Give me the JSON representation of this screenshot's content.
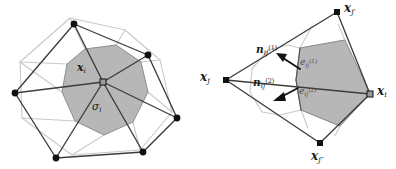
{
  "figure": {
    "kind": "diagram",
    "background_color": "#ffffff",
    "cell_fill_color": "#b7b7b7",
    "primal_edge_color": "#3c3c3c",
    "dual_edge_color": "#c9c9c9",
    "node_color": "#111111"
  },
  "left_panel": {
    "name": "control-volume-panel",
    "center_label": "x",
    "center_subscript": "i",
    "cell_label": "σ",
    "cell_subscript": "i",
    "center_node": {
      "x": 103,
      "y": 82
    },
    "neighbor_nodes": [
      {
        "id": "n-top",
        "x": 74,
        "y": 24
      },
      {
        "id": "n-upper-right",
        "x": 148,
        "y": 55
      },
      {
        "id": "n-right",
        "x": 177,
        "y": 118
      },
      {
        "id": "n-bottom",
        "x": 143,
        "y": 152
      },
      {
        "id": "n-bottom-left",
        "x": 56,
        "y": 158
      },
      {
        "id": "n-left",
        "x": 15,
        "y": 93
      }
    ],
    "cell_polygon": [
      [
        85,
        49
      ],
      [
        116,
        45
      ],
      [
        141,
        62
      ],
      [
        148,
        92
      ],
      [
        133,
        122
      ],
      [
        104,
        135
      ],
      [
        75,
        121
      ],
      [
        62,
        92
      ],
      [
        67,
        64
      ]
    ],
    "outer_dual_polygon": [
      [
        70,
        18
      ],
      [
        125,
        30
      ],
      [
        160,
        60
      ],
      [
        172,
        112
      ],
      [
        140,
        150
      ],
      [
        72,
        155
      ],
      [
        22,
        118
      ],
      [
        20,
        62
      ]
    ]
  },
  "right_panel": {
    "name": "interface-detail-panel",
    "nodes": [
      {
        "id": "x-j",
        "label": "x",
        "subscript": "j",
        "prime": "",
        "x": 226,
        "y": 80,
        "label_x": 200,
        "label_y": 72
      },
      {
        "id": "x-j-prime",
        "label": "x",
        "subscript": "j",
        "prime": "′",
        "x": 337,
        "y": 12,
        "label_x": 344,
        "label_y": 2
      },
      {
        "id": "x-i",
        "label": "x",
        "subscript": "i",
        "prime": "",
        "x": 370,
        "y": 94,
        "label_x": 377,
        "label_y": 86
      },
      {
        "id": "x-j-dprime",
        "label": "x",
        "subscript": "j",
        "prime": "″",
        "x": 320,
        "y": 143,
        "label_x": 313,
        "label_y": 150
      }
    ],
    "normals": [
      {
        "id": "normal-1",
        "label": "n",
        "subscript": "ij",
        "superscript": "(1)",
        "label_x": 258,
        "label_y": 46,
        "tail_x": 300,
        "tail_y": 69,
        "tip_x": 278,
        "tip_y": 56
      },
      {
        "id": "normal-2",
        "label": "n",
        "subscript": "ij",
        "superscript": "(2)",
        "label_x": 255,
        "label_y": 79,
        "tail_x": 298,
        "tail_y": 88,
        "tip_x": 275,
        "tip_y": 100
      }
    ],
    "faces": [
      {
        "id": "face-1",
        "label": "e",
        "subscript": "ij",
        "superscript": "(1)",
        "label_x": 300,
        "label_y": 60
      },
      {
        "id": "face-2",
        "label": "e",
        "subscript": "ij",
        "superscript": "(2)",
        "label_x": 299,
        "label_y": 89
      }
    ],
    "cell_polygon": [
      [
        300,
        48
      ],
      [
        345,
        40
      ],
      [
        370,
        94
      ],
      [
        340,
        126
      ],
      [
        301,
        110
      ],
      [
        296,
        80
      ]
    ],
    "outer_dual_polygon": [
      [
        300,
        48
      ],
      [
        301,
        110
      ],
      [
        280,
        115
      ],
      [
        262,
        112
      ],
      [
        250,
        92
      ],
      [
        252,
        69
      ],
      [
        268,
        50
      ],
      [
        288,
        45
      ]
    ],
    "interface_edges": [
      [
        [
          296,
          80
        ],
        [
          300,
          48
        ]
      ],
      [
        [
          296,
          80
        ],
        [
          301,
          110
        ]
      ]
    ]
  }
}
